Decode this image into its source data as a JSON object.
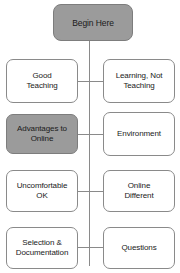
{
  "diagram": {
    "type": "flowchart",
    "colors": {
      "shaded_fill": "#9b9b9b",
      "plain_fill": "#ffffff",
      "border": "#8a8a8a",
      "text": "#1a1a1a"
    },
    "root": {
      "label": "Begin Here",
      "fill": "shaded"
    },
    "rows": [
      {
        "left": {
          "label": "Good\nTeaching",
          "fill": "plain"
        },
        "right": {
          "label": "Learning, Not\nTeaching",
          "fill": "plain"
        }
      },
      {
        "left": {
          "label": "Advantages to\nOnline",
          "fill": "shaded"
        },
        "right": {
          "label": "Environment",
          "fill": "plain"
        }
      },
      {
        "left": {
          "label": "Uncomfortable\nOK",
          "fill": "plain"
        },
        "right": {
          "label": "Online\nDifferent",
          "fill": "plain"
        }
      },
      {
        "left": {
          "label": "Selection &\nDocumentation",
          "fill": "plain"
        },
        "right": {
          "label": "Questions",
          "fill": "plain"
        }
      }
    ]
  }
}
